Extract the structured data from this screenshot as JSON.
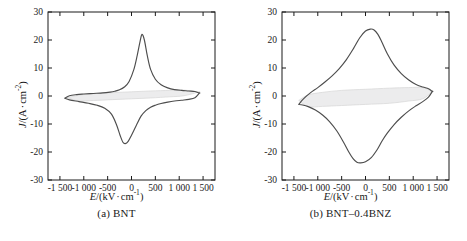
{
  "figure": {
    "type": "two-panel-scientific-figure",
    "background": "#ffffff",
    "curve_color": "#4d4d4d",
    "shade_fill": "#ececed",
    "axis_color": "#1a1a1a"
  },
  "axis": {
    "x_title_prefix": "E",
    "x_title_body": "/(kV",
    "x_title_mid": "cm",
    "x_title_exp": "-1",
    "x_title_suffix": ")",
    "x_title_full": "E/(kV · cm⁻¹)",
    "y_title_prefix": "J",
    "y_title_body": "/(A",
    "y_title_mid": "cm",
    "y_title_exp": "-2",
    "y_title_suffix": ")",
    "y_title_full": "J/(A · cm⁻²)",
    "x_ticks": [
      "-1 500",
      "-1 000",
      "-500",
      "0",
      "500",
      "1 000",
      "1 500"
    ],
    "x_tick_values": [
      -1500,
      -1000,
      -500,
      0,
      500,
      1000,
      1500
    ],
    "y_ticks": [
      "30",
      "20",
      "10",
      "0",
      "-10",
      "-20",
      "-30"
    ],
    "y_tick_values": [
      30,
      20,
      10,
      0,
      -10,
      -20,
      -30
    ],
    "xlim": [
      -1750,
      1750
    ],
    "ylim": [
      -30,
      30
    ],
    "grid": false
  },
  "panels": [
    {
      "id": "a",
      "caption": "(a) BNT",
      "label": "(a)",
      "sample": "BNT"
    },
    {
      "id": "b",
      "caption": "(b) BNT–0.4BNZ",
      "label": "(b)",
      "sample": "BNT–0.4BNZ"
    }
  ],
  "chart_data": [
    {
      "type": "line",
      "panel": "a",
      "title": "(a) BNT",
      "xlabel": "E/(kV · cm⁻¹)",
      "ylabel": "J/(A · cm⁻²)",
      "xlim": [
        -1750,
        1750
      ],
      "ylim": [
        -30,
        30
      ],
      "xticks": [
        -1500,
        -1000,
        -500,
        0,
        500,
        1000,
        1500
      ],
      "yticks": [
        -30,
        -20,
        -10,
        0,
        10,
        20,
        30
      ],
      "grid": false,
      "legend": null,
      "annotations": [],
      "series": [
        {
          "name": "upper-branch-positive-switching",
          "comment": "forward sweep, sharp positive current peak ~22 A/cm2 near E=+200 kV/cm",
          "x": [
            -1400,
            -1300,
            -1150,
            -1000,
            -800,
            -600,
            -450,
            -350,
            -250,
            -150,
            -50,
            50,
            120,
            180,
            220,
            270,
            330,
            400,
            500,
            620,
            760,
            900,
            1050,
            1200,
            1330,
            1420
          ],
          "y": [
            -0.8,
            0.1,
            0.5,
            0.7,
            0.9,
            1.1,
            1.4,
            1.7,
            2.2,
            3.2,
            5.2,
            9.5,
            14.5,
            19.5,
            22.0,
            20.0,
            14.5,
            9.5,
            6.0,
            4.0,
            2.9,
            2.3,
            2.0,
            1.8,
            1.6,
            1.0
          ]
        },
        {
          "name": "lower-branch-negative-switching",
          "comment": "reverse sweep, sharp negative current peak ~-17 A/cm2 near E=-150 kV/cm",
          "x": [
            1420,
            1330,
            1200,
            1050,
            900,
            760,
            620,
            500,
            400,
            300,
            200,
            100,
            0,
            -70,
            -130,
            -180,
            -240,
            -320,
            -420,
            -560,
            -720,
            -900,
            -1100,
            -1300,
            -1400
          ],
          "y": [
            1.0,
            -0.6,
            -1.2,
            -1.5,
            -1.8,
            -2.2,
            -2.7,
            -3.3,
            -4.0,
            -5.2,
            -7.2,
            -10.5,
            -14.0,
            -16.2,
            -17.0,
            -16.5,
            -14.0,
            -10.0,
            -6.5,
            -4.4,
            -3.3,
            -2.6,
            -2.0,
            -1.4,
            -0.8
          ]
        },
        {
          "name": "inner-shaded-lens",
          "comment": "thin slanted lens-shaped shaded region straddling J=0, spanning roughly E=-1350..1400",
          "fill": "#ececed",
          "upper_x": [
            -1350,
            -1100,
            -800,
            -400,
            0,
            400,
            800,
            1100,
            1400
          ],
          "upper_y": [
            -0.6,
            0.3,
            0.8,
            1.2,
            1.5,
            1.8,
            2.0,
            2.1,
            1.4
          ],
          "lower_x": [
            1400,
            1100,
            800,
            400,
            0,
            -400,
            -800,
            -1100,
            -1350
          ],
          "lower_y": [
            1.4,
            0.1,
            -0.3,
            -0.7,
            -1.0,
            -1.3,
            -1.6,
            -1.8,
            -0.6
          ]
        }
      ]
    },
    {
      "type": "line",
      "panel": "b",
      "title": "(b) BNT–0.4BNZ",
      "xlabel": "E/(kV · cm⁻¹)",
      "ylabel": "J/(A · cm⁻²)",
      "xlim": [
        -1750,
        1750
      ],
      "ylim": [
        -30,
        30
      ],
      "xticks": [
        -1500,
        -1000,
        -500,
        0,
        500,
        1000,
        1500
      ],
      "yticks": [
        -30,
        -20,
        -10,
        0,
        10,
        20,
        30
      ],
      "grid": false,
      "legend": null,
      "annotations": [],
      "series": [
        {
          "name": "upper-branch-positive-switching",
          "comment": "broad rounded positive current peak ~24 A/cm2 near E=+150 kV/cm",
          "x": [
            -1400,
            -1300,
            -1150,
            -1000,
            -850,
            -700,
            -550,
            -400,
            -250,
            -120,
            0,
            100,
            180,
            260,
            350,
            460,
            600,
            750,
            900,
            1050,
            1200,
            1320,
            1400
          ],
          "y": [
            -3.0,
            -1.0,
            1.2,
            3.0,
            5.0,
            7.2,
            9.8,
            13.0,
            17.0,
            20.8,
            23.2,
            23.9,
            23.6,
            22.0,
            19.0,
            15.0,
            11.0,
            8.0,
            5.8,
            4.2,
            3.2,
            2.6,
            1.6
          ]
        },
        {
          "name": "lower-branch-negative-switching",
          "comment": "broad rounded negative current peak ~-24 A/cm2 near E=-150 kV/cm",
          "x": [
            1400,
            1320,
            1200,
            1050,
            900,
            750,
            600,
            460,
            350,
            250,
            120,
            0,
            -100,
            -180,
            -260,
            -350,
            -460,
            -600,
            -750,
            -900,
            -1050,
            -1200,
            -1320,
            -1400
          ],
          "y": [
            1.6,
            -0.4,
            -2.0,
            -3.6,
            -5.4,
            -7.6,
            -10.2,
            -13.2,
            -16.0,
            -19.0,
            -22.0,
            -23.5,
            -23.9,
            -23.7,
            -22.4,
            -20.0,
            -16.5,
            -12.5,
            -9.2,
            -6.8,
            -5.0,
            -3.8,
            -3.2,
            -3.0
          ]
        },
        {
          "name": "inner-shaded-lens",
          "comment": "thick slanted shaded band straddling J=0, much wider than panel (a)",
          "fill": "#ececed",
          "upper_x": [
            -1400,
            -1200,
            -900,
            -500,
            0,
            500,
            900,
            1200,
            1400
          ],
          "upper_y": [
            -1.6,
            0.4,
            1.3,
            2.0,
            2.4,
            2.8,
            3.0,
            3.0,
            1.6
          ],
          "lower_x": [
            1400,
            1200,
            900,
            500,
            0,
            -500,
            -900,
            -1200,
            -1400
          ],
          "lower_y": [
            1.6,
            -1.0,
            -1.8,
            -2.6,
            -3.0,
            -3.4,
            -3.7,
            -3.8,
            -1.6
          ]
        }
      ]
    }
  ]
}
